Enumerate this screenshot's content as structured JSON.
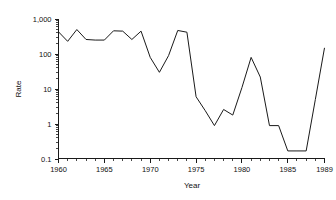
{
  "chart_data": {
    "type": "line",
    "title": "",
    "xlabel": "Year",
    "ylabel": "Rate",
    "yscale": "log",
    "ylim": [
      0.1,
      1000
    ],
    "xlim": [
      1960,
      1989
    ],
    "grid": false,
    "legend": null,
    "y_tick_labels": [
      "1,000",
      "100",
      "10",
      "1",
      "0.1"
    ],
    "y_tick_values": [
      1000,
      100,
      10,
      1,
      0.1
    ],
    "x_tick_labels": [
      "1960",
      "1965",
      "1970",
      "1975",
      "1980",
      "1985",
      "1989"
    ],
    "x_tick_values": [
      1960,
      1965,
      1970,
      1975,
      1980,
      1985,
      1989
    ],
    "x": [
      1960,
      1961,
      1962,
      1963,
      1964,
      1965,
      1966,
      1967,
      1968,
      1969,
      1970,
      1971,
      1972,
      1973,
      1974,
      1975,
      1976,
      1977,
      1978,
      1979,
      1980,
      1981,
      1982,
      1983,
      1984,
      1985,
      1986,
      1987,
      1988,
      1989
    ],
    "values": [
      430,
      230,
      500,
      260,
      250,
      250,
      460,
      450,
      260,
      450,
      80,
      30,
      90,
      470,
      420,
      6,
      2.4,
      0.9,
      2.6,
      1.8,
      11,
      80,
      22,
      0.9,
      0.9,
      0.17,
      0.17,
      0.17,
      5,
      150
    ],
    "series": [
      {
        "name": "Rate",
        "values": [
          430,
          230,
          500,
          260,
          250,
          250,
          460,
          450,
          260,
          450,
          80,
          30,
          90,
          470,
          420,
          6,
          2.4,
          0.9,
          2.6,
          1.8,
          11,
          80,
          22,
          0.9,
          0.9,
          0.17,
          0.17,
          0.17,
          5,
          150
        ],
        "color": "#1a1a1a"
      }
    ],
    "annotations": []
  }
}
